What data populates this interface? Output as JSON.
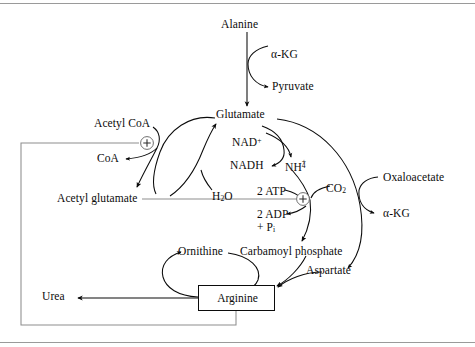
{
  "figure": {
    "type": "pathway-diagram",
    "background": "#ffffff",
    "ink": "#0b0b0b",
    "rule_color": "#9a9a9a"
  },
  "nodes": {
    "alanine": "Alanine",
    "akg_top": "α-KG",
    "pyruvate": "Pyruvate",
    "glutamate": "Glutamate",
    "acetyl_coa": "Acetyl CoA",
    "coa": "CoA",
    "acetyl_glutamate": "Acetyl glutamate",
    "nad_plus": "NAD",
    "nad_plus_charge": "+",
    "nadh": "NADH",
    "ammonium_base": "NH",
    "ammonium_sub": "4",
    "ammonium_sup": "+",
    "water_base": "H",
    "water_sub": "2",
    "water_tail": "O",
    "two_atp": "2 ATP",
    "two_adp": "2 ADP",
    "plus_pi_prefix": "+ P",
    "plus_pi_sub": "i",
    "co2_base": "CO",
    "co2_sub": "2",
    "oxaloacetate": "Oxaloacetate",
    "akg_right": "α-KG",
    "ornithine": "Ornithine",
    "carbamoyl_phosphate": "Carbamoyl phosphate",
    "aspartate": "Aspartate",
    "arginine": "Arginine",
    "urea": "Urea"
  },
  "regulators": [
    {
      "name": "activation-acetyl-coa",
      "symbol": "+",
      "meaning": "activation"
    },
    {
      "name": "activation-acetyl-glutamate",
      "symbol": "+",
      "meaning": "activation"
    }
  ]
}
